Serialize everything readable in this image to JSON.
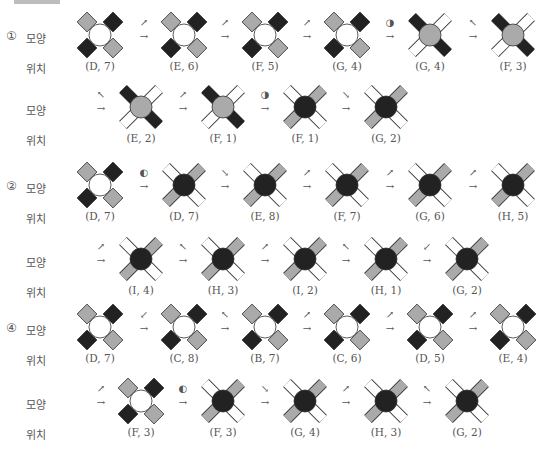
{
  "header": {
    "label": ""
  },
  "labels": {
    "shape": "모양",
    "position": "위치"
  },
  "colors": {
    "black": "#222222",
    "gray": "#aaaaaa",
    "white": "#ffffff",
    "stroke": "#333333"
  },
  "sequences": [
    {
      "number": "①",
      "rows": [
        {
          "steps": [
            {
              "arm": "A",
              "center": "white",
              "pos": "(D, 7)"
            },
            {
              "move": "↗",
              "arm": "A",
              "center": "white",
              "pos": "(E, 6)"
            },
            {
              "move": "↗",
              "arm": "A",
              "center": "white",
              "pos": "(F, 5)"
            },
            {
              "move": "↗",
              "arm": "A",
              "center": "white",
              "pos": "(G, 4)"
            },
            {
              "move": "◑",
              "arm": "B",
              "center": "gray",
              "pos": "(G, 4)"
            },
            {
              "move": "↖",
              "arm": "B",
              "center": "gray",
              "pos": "(F, 3)"
            }
          ]
        },
        {
          "steps": [
            {
              "move": "↖",
              "arm": "B",
              "center": "gray",
              "pos": "(E, 2)"
            },
            {
              "move": "↗",
              "arm": "B",
              "center": "gray",
              "pos": "(F, 1)"
            },
            {
              "move": "◑",
              "arm": "C",
              "center": "black",
              "pos": "(F, 1)"
            },
            {
              "move": "↘",
              "arm": "C",
              "center": "black",
              "pos": "(G, 2)"
            }
          ]
        }
      ]
    },
    {
      "number": "②",
      "rows": [
        {
          "steps": [
            {
              "arm": "A",
              "center": "white",
              "pos": "(D, 7)"
            },
            {
              "move": "◐",
              "arm": "C",
              "center": "black",
              "pos": "(D, 7)"
            },
            {
              "move": "↘",
              "arm": "C",
              "center": "black",
              "pos": "(E, 8)"
            },
            {
              "move": "↗",
              "arm": "C",
              "center": "black",
              "pos": "(F, 7)"
            },
            {
              "move": "↗",
              "arm": "C",
              "center": "black",
              "pos": "(G, 6)"
            },
            {
              "move": "↗",
              "arm": "C",
              "center": "black",
              "pos": "(H, 5)"
            }
          ]
        },
        {
          "steps": [
            {
              "move": "↗",
              "arm": "C",
              "center": "black",
              "pos": "(I, 4)"
            },
            {
              "move": "↖",
              "arm": "C",
              "center": "black",
              "pos": "(H, 3)"
            },
            {
              "move": "↗",
              "arm": "C",
              "center": "black",
              "pos": "(I, 2)"
            },
            {
              "move": "↖",
              "arm": "C",
              "center": "black",
              "pos": "(H, 1)"
            },
            {
              "move": "↙",
              "arm": "C",
              "center": "black",
              "pos": "(G, 2)"
            }
          ]
        }
      ]
    },
    {
      "number": "④",
      "rows": [
        {
          "steps": [
            {
              "arm": "A",
              "center": "white",
              "pos": "(D, 7)"
            },
            {
              "move": "↙",
              "arm": "A",
              "center": "white",
              "pos": "(C, 8)"
            },
            {
              "move": "↖",
              "arm": "A",
              "center": "white",
              "pos": "(B, 7)"
            },
            {
              "move": "↗",
              "arm": "A",
              "center": "white",
              "pos": "(C, 6)"
            },
            {
              "move": "↗",
              "arm": "A",
              "center": "white",
              "pos": "(D, 5)"
            },
            {
              "move": "↗",
              "arm": "A",
              "center": "white",
              "pos": "(E, 4)"
            }
          ]
        },
        {
          "steps": [
            {
              "move": "↗",
              "arm": "A",
              "center": "white",
              "pos": "(F, 3)"
            },
            {
              "move": "◐",
              "arm": "C",
              "center": "black",
              "pos": "(F, 3)"
            },
            {
              "move": "↘",
              "arm": "C",
              "center": "black",
              "pos": "(G, 4)"
            },
            {
              "move": "↗",
              "arm": "C",
              "center": "black",
              "pos": "(H, 3)"
            },
            {
              "move": "↖",
              "arm": "C",
              "center": "black",
              "pos": "(G, 2)"
            }
          ]
        }
      ]
    }
  ]
}
